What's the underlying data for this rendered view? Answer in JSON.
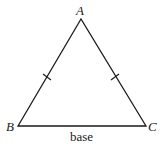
{
  "figure": {
    "type": "isosceles-triangle",
    "vertices": {
      "A": {
        "label": "A",
        "x": 81,
        "y": 19
      },
      "B": {
        "label": "B",
        "x": 18,
        "y": 126
      },
      "C": {
        "label": "C",
        "x": 146,
        "y": 126
      }
    },
    "base_label": "base",
    "congruence_marks": [
      "AB",
      "AC"
    ],
    "stroke_color": "#1a1a1a"
  }
}
